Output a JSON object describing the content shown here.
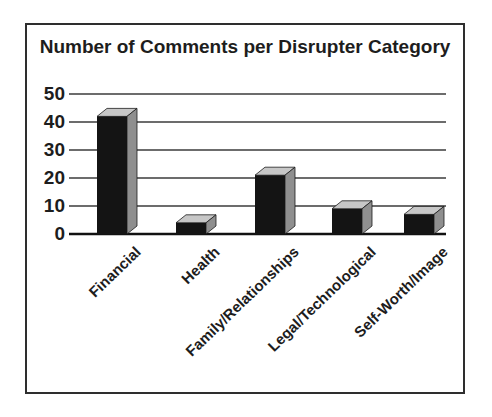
{
  "chart_data": {
    "type": "bar",
    "title": "Number of Comments per Disrupter Category",
    "categories": [
      "Financial",
      "Health",
      "Family/Relationships",
      "Legal/Technological",
      "Self-Worth/Image"
    ],
    "values": [
      42,
      4,
      21,
      9,
      7
    ],
    "xlabel": "",
    "ylabel": "",
    "ylim": [
      0,
      50
    ],
    "yticks": [
      0,
      10,
      20,
      30,
      40,
      50
    ],
    "grid": true,
    "legend": false,
    "bar_style": "3d-extruded",
    "colors": {
      "bar_front": "#141414",
      "bar_top": "#c7c7c7",
      "bar_side": "#8f8f8f",
      "gridline": "#3b3b3b",
      "axis": "#111111",
      "text": "#1d1d1d",
      "frame_border": "#2e2e2e",
      "background": "#ffffff"
    }
  }
}
